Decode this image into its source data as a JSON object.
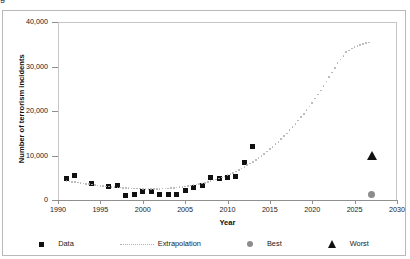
{
  "caption_fragment": "g",
  "chart_data": {
    "type": "scatter",
    "title": "",
    "xlabel": "Year",
    "ylabel": "Number of terrorism incidents",
    "xlim": [
      1990,
      2030
    ],
    "ylim": [
      0,
      40000
    ],
    "xticks": [
      1990,
      1995,
      2000,
      2005,
      2010,
      2015,
      2020,
      2025,
      2030
    ],
    "xtick_labels": [
      "1990",
      "1995",
      "2000",
      "2005",
      "2010",
      "2015",
      "2020",
      "2025",
      "2030"
    ],
    "yticks": [
      0,
      10000,
      20000,
      30000,
      40000
    ],
    "ytick_labels": [
      "0",
      "10,000",
      "20,000",
      "30,000",
      "40,000"
    ],
    "grid": false,
    "legend_position": "bottom",
    "series": [
      {
        "name": "Data",
        "marker": "square",
        "color": "#111111",
        "x": [
          1991,
          1992,
          1994,
          1996,
          1997,
          1998,
          1999,
          2000,
          2001,
          2002,
          2003,
          2004,
          2005,
          2006,
          2007,
          2008,
          2009,
          2010,
          2011,
          2012,
          2013
        ],
        "values": [
          4800,
          5400,
          3600,
          3000,
          3300,
          1000,
          1300,
          1800,
          1900,
          1200,
          1200,
          1200,
          2100,
          2800,
          3300,
          5100,
          4900,
          5000,
          5200,
          8500,
          12000
        ]
      },
      {
        "name": "Extrapolation",
        "marker": "dotted-line",
        "color": "#b0b0b0",
        "x": [
          1991,
          1992,
          1993,
          1994,
          1995,
          1996,
          1997,
          1998,
          1999,
          2000,
          2001,
          2002,
          2003,
          2004,
          2005,
          2006,
          2007,
          2008,
          2009,
          2010,
          2011,
          2012,
          2013,
          2014,
          2015,
          2016,
          2017,
          2018,
          2019,
          2020,
          2021,
          2022,
          2023,
          2024,
          2025,
          2026,
          2027
        ],
        "values": [
          4300,
          4000,
          3700,
          3450,
          3200,
          3000,
          2820,
          2680,
          2580,
          2520,
          2500,
          2530,
          2620,
          2780,
          3010,
          3320,
          3720,
          4220,
          4830,
          5560,
          6420,
          7420,
          8580,
          9900,
          11400,
          13100,
          14980,
          17060,
          19350,
          21860,
          24600,
          27580,
          30800,
          33200,
          34400,
          35100,
          35500
        ]
      },
      {
        "name": "Best",
        "marker": "circle",
        "color": "#8c8c8c",
        "x": [
          2027
        ],
        "values": [
          1200
        ]
      },
      {
        "name": "Worst",
        "marker": "triangle",
        "color": "#111111",
        "x": [
          2027
        ],
        "values": [
          10200
        ]
      }
    ],
    "legend": [
      {
        "label": "Data",
        "marker": "square",
        "color": "#111111"
      },
      {
        "label": "Extrapolation",
        "marker": "dotted-line",
        "color": "#b0b0b0"
      },
      {
        "label": "Best",
        "marker": "circle",
        "color": "#8c8c8c"
      },
      {
        "label": "Worst",
        "marker": "triangle",
        "color": "#111111"
      }
    ]
  }
}
